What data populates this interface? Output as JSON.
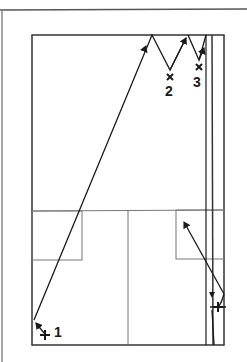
{
  "diagram": {
    "type": "basketball-half-court-drill",
    "colors": {
      "line": "#1a1a1a",
      "court": "#444444",
      "paint": "#666666",
      "background": "#ffffff"
    },
    "players": [
      {
        "id": "1",
        "symbol": "offense-plus",
        "label": "1"
      },
      {
        "id": "2",
        "symbol": "defense-x",
        "label": "2"
      },
      {
        "id": "3",
        "symbol": "defense-x",
        "label": "3"
      },
      {
        "id": "4",
        "symbol": "offense-plus",
        "label": ""
      }
    ],
    "labels": {
      "p1": "1",
      "p2": "2",
      "p3": "3"
    }
  }
}
